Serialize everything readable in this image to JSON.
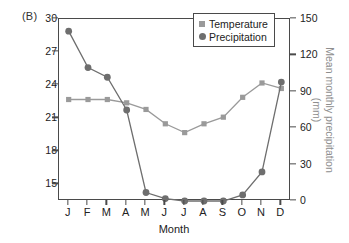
{
  "panel": {
    "label": "(B)"
  },
  "legend": {
    "items": [
      {
        "label": "Temperature",
        "marker": "square-marker-icon",
        "color": "#9a9a9a"
      },
      {
        "label": "Precipitation",
        "marker": "circle-marker-icon",
        "color": "#6e6e6e"
      }
    ]
  },
  "axes": {
    "left": {
      "title": "Mean monthly temperature (°C)",
      "ticks": [
        "30",
        "27",
        "24",
        "21",
        "18",
        "15"
      ]
    },
    "right": {
      "title": "Mean monthly precipitation (mm)",
      "ticks": [
        "150",
        "120",
        "90",
        "60",
        "30",
        "0"
      ]
    },
    "bottom": {
      "title": "Month",
      "ticks": [
        "J",
        "F",
        "M",
        "A",
        "M",
        "J",
        "J",
        "A",
        "S",
        "O",
        "N",
        "D"
      ]
    }
  },
  "chart_data": {
    "type": "line",
    "title": "(B)",
    "xlabel": "Month",
    "ylabel": "Mean monthly temperature (°C)",
    "y2label": "Mean monthly precipitation (mm)",
    "categories": [
      "J",
      "F",
      "M",
      "A",
      "M",
      "J",
      "J",
      "A",
      "S",
      "O",
      "N",
      "D"
    ],
    "grid": false,
    "legend_position": "top-right",
    "ylim": [
      13.5,
      30
    ],
    "ytick_values": [
      30,
      27,
      24,
      21,
      18,
      15
    ],
    "y2lim": [
      0,
      150
    ],
    "y2tick_values": [
      150,
      120,
      90,
      60,
      30,
      0
    ],
    "series": [
      {
        "name": "Temperature",
        "axis": "left",
        "units": "°C",
        "marker": "square",
        "color": "#9a9a9a",
        "values": [
          22.7,
          22.7,
          22.7,
          22.4,
          21.8,
          20.5,
          19.7,
          20.5,
          21.1,
          22.9,
          24.2,
          23.7
        ]
      },
      {
        "name": "Precipitation",
        "axis": "right",
        "units": "mm",
        "marker": "circle",
        "color": "#6e6e6e",
        "values": [
          140,
          110,
          102,
          75,
          7,
          2,
          0,
          0,
          0,
          5,
          24,
          98
        ]
      }
    ]
  }
}
